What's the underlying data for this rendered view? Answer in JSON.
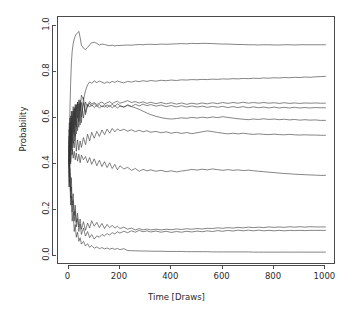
{
  "chart_data": {
    "type": "line",
    "title": "",
    "subtitle": "",
    "xlabel": "Time [Draws]",
    "ylabel": "Probability",
    "xlim": [
      0,
      1000
    ],
    "ylim": [
      0.0,
      1.0
    ],
    "xticks": [
      "0",
      "200",
      "400",
      "600",
      "800",
      "1000"
    ],
    "xtick_values": [
      0,
      200,
      400,
      600,
      800,
      1000
    ],
    "yticks": [
      "0.0",
      "0.2",
      "0.4",
      "0.6",
      "0.8",
      "1.0"
    ],
    "ytick_values": [
      0.0,
      0.2,
      0.4,
      0.6,
      0.8,
      1.0
    ],
    "grid": false,
    "legend": null,
    "legend_position": "none",
    "line_color": "#333333",
    "line_width": 0.6,
    "background_color": "#ffffff",
    "frame_color": "#4a4a4a",
    "n_series": 10,
    "x": [
      1,
      3,
      5,
      8,
      11,
      14,
      18,
      22,
      26,
      30,
      35,
      40,
      45,
      50,
      58,
      66,
      74,
      82,
      90,
      100,
      110,
      120,
      130,
      140,
      150,
      160,
      170,
      180,
      190,
      200,
      215,
      230,
      245,
      260,
      275,
      290,
      305,
      320,
      340,
      360,
      380,
      400,
      420,
      440,
      460,
      480,
      500,
      520,
      540,
      560,
      580,
      600,
      620,
      640,
      660,
      680,
      700,
      720,
      740,
      760,
      780,
      800,
      820,
      840,
      860,
      880,
      900,
      920,
      940,
      960,
      980,
      1000
    ],
    "series": [
      {
        "name": "trace-1",
        "final_value": 0.92,
        "values": [
          0.3,
          0.46,
          0.62,
          0.75,
          0.84,
          0.89,
          0.925,
          0.945,
          0.958,
          0.966,
          0.972,
          0.978,
          0.952,
          0.918,
          0.905,
          0.899,
          0.908,
          0.92,
          0.928,
          0.931,
          0.926,
          0.919,
          0.923,
          0.921,
          0.918,
          0.916,
          0.918,
          0.915,
          0.917,
          0.917,
          0.918,
          0.919,
          0.918,
          0.92,
          0.921,
          0.92,
          0.922,
          0.922,
          0.921,
          0.923,
          0.922,
          0.923,
          0.924,
          0.925,
          0.924,
          0.926,
          0.925,
          0.926,
          0.926,
          0.925,
          0.924,
          0.923,
          0.923,
          0.922,
          0.921,
          0.921,
          0.92,
          0.92,
          0.919,
          0.92,
          0.92,
          0.919,
          0.919,
          0.92,
          0.92,
          0.919,
          0.92,
          0.92,
          0.92,
          0.92,
          0.92,
          0.92
        ]
      },
      {
        "name": "trace-2",
        "final_value": 0.782,
        "values": [
          0.4,
          0.52,
          0.45,
          0.58,
          0.5,
          0.61,
          0.54,
          0.64,
          0.57,
          0.66,
          0.6,
          0.68,
          0.63,
          0.7,
          0.68,
          0.72,
          0.745,
          0.758,
          0.752,
          0.762,
          0.755,
          0.761,
          0.757,
          0.752,
          0.758,
          0.754,
          0.76,
          0.756,
          0.762,
          0.758,
          0.754,
          0.76,
          0.757,
          0.762,
          0.759,
          0.763,
          0.76,
          0.764,
          0.761,
          0.765,
          0.763,
          0.766,
          0.764,
          0.767,
          0.766,
          0.768,
          0.767,
          0.769,
          0.768,
          0.77,
          0.769,
          0.771,
          0.77,
          0.772,
          0.771,
          0.773,
          0.772,
          0.774,
          0.773,
          0.775,
          0.774,
          0.776,
          0.775,
          0.777,
          0.776,
          0.778,
          0.777,
          0.779,
          0.778,
          0.78,
          0.781,
          0.782
        ]
      },
      {
        "name": "trace-3",
        "final_value": 0.665,
        "values": [
          0.5,
          0.39,
          0.56,
          0.44,
          0.6,
          0.47,
          0.63,
          0.5,
          0.65,
          0.53,
          0.67,
          0.56,
          0.68,
          0.58,
          0.69,
          0.615,
          0.655,
          0.672,
          0.662,
          0.668,
          0.659,
          0.665,
          0.67,
          0.661,
          0.667,
          0.672,
          0.663,
          0.669,
          0.674,
          0.665,
          0.67,
          0.676,
          0.668,
          0.672,
          0.666,
          0.671,
          0.664,
          0.669,
          0.663,
          0.668,
          0.662,
          0.667,
          0.661,
          0.666,
          0.66,
          0.665,
          0.661,
          0.666,
          0.662,
          0.667,
          0.663,
          0.668,
          0.664,
          0.668,
          0.665,
          0.669,
          0.665,
          0.668,
          0.665,
          0.668,
          0.665,
          0.667,
          0.664,
          0.667,
          0.664,
          0.666,
          0.664,
          0.666,
          0.665,
          0.666,
          0.665,
          0.665
        ]
      },
      {
        "name": "trace-4",
        "final_value": 0.645,
        "values": [
          0.55,
          0.42,
          0.6,
          0.47,
          0.63,
          0.5,
          0.65,
          0.53,
          0.66,
          0.56,
          0.67,
          0.585,
          0.672,
          0.605,
          0.668,
          0.625,
          0.66,
          0.648,
          0.658,
          0.646,
          0.656,
          0.644,
          0.654,
          0.648,
          0.658,
          0.65,
          0.66,
          0.652,
          0.662,
          0.655,
          0.648,
          0.658,
          0.651,
          0.66,
          0.653,
          0.661,
          0.654,
          0.659,
          0.652,
          0.657,
          0.65,
          0.655,
          0.649,
          0.654,
          0.648,
          0.653,
          0.648,
          0.652,
          0.647,
          0.651,
          0.647,
          0.651,
          0.646,
          0.65,
          0.646,
          0.65,
          0.645,
          0.649,
          0.645,
          0.648,
          0.644,
          0.648,
          0.644,
          0.647,
          0.644,
          0.647,
          0.644,
          0.646,
          0.644,
          0.646,
          0.645,
          0.645
        ]
      },
      {
        "name": "trace-5",
        "final_value": 0.59,
        "values": [
          0.45,
          0.58,
          0.43,
          0.61,
          0.46,
          0.63,
          0.49,
          0.645,
          0.52,
          0.655,
          0.545,
          0.662,
          0.57,
          0.668,
          0.6,
          0.67,
          0.648,
          0.665,
          0.652,
          0.664,
          0.65,
          0.66,
          0.648,
          0.658,
          0.646,
          0.656,
          0.645,
          0.654,
          0.644,
          0.652,
          0.648,
          0.655,
          0.65,
          0.645,
          0.638,
          0.63,
          0.622,
          0.615,
          0.608,
          0.602,
          0.598,
          0.596,
          0.598,
          0.601,
          0.599,
          0.603,
          0.6,
          0.604,
          0.601,
          0.605,
          0.602,
          0.606,
          0.603,
          0.6,
          0.597,
          0.595,
          0.593,
          0.596,
          0.594,
          0.597,
          0.594,
          0.596,
          0.593,
          0.595,
          0.592,
          0.594,
          0.591,
          0.593,
          0.591,
          0.592,
          0.59,
          0.59
        ]
      },
      {
        "name": "trace-6",
        "final_value": 0.525,
        "values": [
          0.52,
          0.38,
          0.54,
          0.41,
          0.56,
          0.44,
          0.5,
          0.47,
          0.53,
          0.455,
          0.505,
          0.46,
          0.5,
          0.472,
          0.515,
          0.484,
          0.53,
          0.5,
          0.538,
          0.512,
          0.542,
          0.52,
          0.548,
          0.528,
          0.552,
          0.534,
          0.555,
          0.54,
          0.553,
          0.545,
          0.551,
          0.543,
          0.549,
          0.541,
          0.547,
          0.54,
          0.545,
          0.538,
          0.542,
          0.536,
          0.54,
          0.534,
          0.538,
          0.533,
          0.537,
          0.532,
          0.536,
          0.54,
          0.544,
          0.541,
          0.537,
          0.534,
          0.531,
          0.534,
          0.531,
          0.534,
          0.531,
          0.529,
          0.531,
          0.529,
          0.528,
          0.53,
          0.528,
          0.527,
          0.529,
          0.527,
          0.526,
          0.527,
          0.526,
          0.526,
          0.525,
          0.525
        ]
      },
      {
        "name": "trace-7",
        "final_value": 0.35,
        "values": [
          0.48,
          0.36,
          0.5,
          0.4,
          0.44,
          0.465,
          0.425,
          0.455,
          0.418,
          0.448,
          0.412,
          0.442,
          0.405,
          0.438,
          0.418,
          0.432,
          0.405,
          0.428,
          0.398,
          0.422,
          0.392,
          0.416,
          0.388,
          0.41,
          0.384,
          0.405,
          0.38,
          0.398,
          0.374,
          0.392,
          0.378,
          0.385,
          0.372,
          0.38,
          0.368,
          0.376,
          0.37,
          0.374,
          0.368,
          0.372,
          0.366,
          0.37,
          0.365,
          0.369,
          0.372,
          0.376,
          0.373,
          0.377,
          0.374,
          0.378,
          0.375,
          0.372,
          0.375,
          0.372,
          0.374,
          0.371,
          0.373,
          0.37,
          0.368,
          0.366,
          0.364,
          0.362,
          0.36,
          0.358,
          0.357,
          0.355,
          0.354,
          0.353,
          0.352,
          0.351,
          0.35,
          0.35
        ]
      },
      {
        "name": "trace-8",
        "final_value": 0.125,
        "values": [
          0.46,
          0.34,
          0.42,
          0.28,
          0.34,
          0.22,
          0.27,
          0.175,
          0.22,
          0.145,
          0.185,
          0.125,
          0.16,
          0.115,
          0.148,
          0.11,
          0.142,
          0.12,
          0.152,
          0.128,
          0.145,
          0.122,
          0.14,
          0.118,
          0.136,
          0.122,
          0.132,
          0.12,
          0.128,
          0.118,
          0.124,
          0.115,
          0.12,
          0.112,
          0.118,
          0.112,
          0.116,
          0.112,
          0.115,
          0.112,
          0.115,
          0.113,
          0.116,
          0.114,
          0.117,
          0.115,
          0.118,
          0.116,
          0.119,
          0.118,
          0.121,
          0.119,
          0.122,
          0.12,
          0.123,
          0.121,
          0.124,
          0.122,
          0.124,
          0.122,
          0.125,
          0.123,
          0.125,
          0.123,
          0.126,
          0.124,
          0.126,
          0.124,
          0.126,
          0.125,
          0.125,
          0.125
        ]
      },
      {
        "name": "trace-9",
        "final_value": 0.11,
        "values": [
          0.44,
          0.32,
          0.38,
          0.25,
          0.3,
          0.19,
          0.24,
          0.15,
          0.195,
          0.125,
          0.162,
          0.105,
          0.138,
          0.092,
          0.12,
          0.085,
          0.105,
          0.078,
          0.092,
          0.072,
          0.086,
          0.08,
          0.092,
          0.086,
          0.096,
          0.09,
          0.1,
          0.094,
          0.104,
          0.098,
          0.106,
          0.1,
          0.108,
          0.102,
          0.11,
          0.104,
          0.108,
          0.103,
          0.107,
          0.102,
          0.106,
          0.101,
          0.105,
          0.102,
          0.106,
          0.103,
          0.107,
          0.104,
          0.108,
          0.105,
          0.109,
          0.106,
          0.11,
          0.107,
          0.111,
          0.108,
          0.111,
          0.108,
          0.111,
          0.108,
          0.11,
          0.108,
          0.11,
          0.108,
          0.11,
          0.109,
          0.11,
          0.109,
          0.11,
          0.11,
          0.11,
          0.11
        ]
      },
      {
        "name": "trace-10",
        "final_value": 0.015,
        "values": [
          0.42,
          0.3,
          0.36,
          0.22,
          0.26,
          0.15,
          0.19,
          0.105,
          0.135,
          0.08,
          0.102,
          0.062,
          0.078,
          0.05,
          0.062,
          0.042,
          0.052,
          0.036,
          0.044,
          0.032,
          0.038,
          0.03,
          0.035,
          0.029,
          0.033,
          0.028,
          0.032,
          0.027,
          0.031,
          0.026,
          0.03,
          0.022,
          0.021,
          0.021,
          0.02,
          0.02,
          0.02,
          0.019,
          0.019,
          0.019,
          0.018,
          0.018,
          0.018,
          0.018,
          0.017,
          0.017,
          0.017,
          0.017,
          0.017,
          0.016,
          0.016,
          0.016,
          0.016,
          0.016,
          0.016,
          0.016,
          0.016,
          0.015,
          0.015,
          0.015,
          0.015,
          0.015,
          0.015,
          0.015,
          0.015,
          0.015,
          0.015,
          0.015,
          0.015,
          0.015,
          0.015,
          0.015
        ]
      }
    ]
  }
}
